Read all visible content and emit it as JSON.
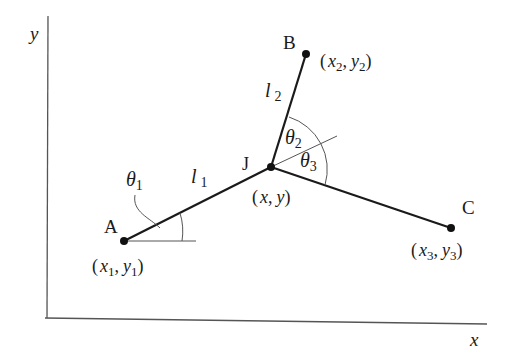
{
  "diagram": {
    "axes": {
      "x_label": "x",
      "y_label": "y"
    },
    "points": {
      "A": {
        "label": "A",
        "coord_label": [
          "x",
          "1",
          "y",
          "1"
        ]
      },
      "B": {
        "label": "B",
        "coord_label": [
          "x",
          "2",
          "y",
          "2"
        ]
      },
      "C": {
        "label": "C",
        "coord_label": [
          "x",
          "3",
          "y",
          "3"
        ]
      },
      "J": {
        "label": "J",
        "coord_label": [
          "x",
          "",
          "y",
          ""
        ]
      }
    },
    "links": {
      "l1": {
        "symbol": "l",
        "sub": "1"
      },
      "l2": {
        "symbol": "l",
        "sub": "2"
      }
    },
    "angles": {
      "theta1": {
        "symbol": "θ",
        "sub": "1"
      },
      "theta2": {
        "symbol": "θ",
        "sub": "2"
      },
      "theta3": {
        "symbol": "θ",
        "sub": "3"
      }
    },
    "punct": {
      "open": "(",
      "comma": ",",
      "close": ")"
    },
    "colors": {
      "line": "#1a1a1a",
      "thin": "#555555"
    }
  }
}
